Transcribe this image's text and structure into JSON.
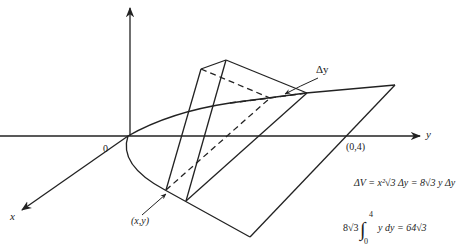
{
  "diagram": {
    "axes": {
      "x_label": "x",
      "y_label": "y",
      "origin_label": "0"
    },
    "labels": {
      "point_label": "(x,y)",
      "intercept_label": "(0,4)",
      "delta_label": "Δy"
    },
    "equations": {
      "volume_element": "ΔV = x²√3 Δy = 8√3 y Δy",
      "integral_coef": "8√3",
      "integral_upper": "4",
      "integral_lower": "0",
      "integral_body": "y dy = 64√3"
    },
    "colors": {
      "stroke": "#222222",
      "background": "#ffffff"
    }
  }
}
